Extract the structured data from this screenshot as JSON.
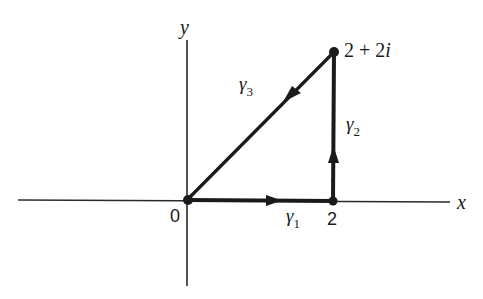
{
  "diagram": {
    "type": "contour-path-complex-plane",
    "axes": {
      "x_label": "x",
      "y_label": "y"
    },
    "points": [
      {
        "id": "origin",
        "label": "0",
        "value": "0"
      },
      {
        "id": "two",
        "label": "2",
        "value": "2"
      },
      {
        "id": "two-plus-two-i",
        "label": "2 + 2i",
        "value": "2 + 2i"
      }
    ],
    "segments": [
      {
        "id": "gamma1",
        "symbol": "γ",
        "subscript": "1",
        "from": "0",
        "to": "2",
        "direction": "right"
      },
      {
        "id": "gamma2",
        "symbol": "γ",
        "subscript": "2",
        "from": "2",
        "to": "2 + 2i",
        "direction": "up"
      },
      {
        "id": "gamma3",
        "symbol": "γ",
        "subscript": "3",
        "from": "2 + 2i",
        "to": "0",
        "direction": "down-left"
      }
    ],
    "colors": {
      "stroke": "#1a1a1a",
      "background": "#ffffff"
    }
  }
}
